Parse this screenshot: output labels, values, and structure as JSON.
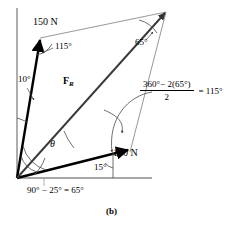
{
  "figure": {
    "caption": "(b)",
    "type": "parallelogram-law force diagram",
    "labels": {
      "force_150": "150 N",
      "force_100": "100 N",
      "resultant": "F",
      "resultant_sub": "R",
      "theta": "θ",
      "angle_115_upper": "115°",
      "angle_10": "10°",
      "angle_65_apex": "65°",
      "angle_15": "15°",
      "bottom_equation": "90° − 25° = 65°"
    },
    "fraction": {
      "numerator": "360°− 2(65°)",
      "denominator": "2",
      "result": "= 115°"
    },
    "colors": {
      "vector_stroke": "#000000",
      "construction_stroke": "#808080",
      "axis_stroke": "#8a8a8a",
      "arc_stroke": "#555555",
      "background": "#ffffff"
    }
  }
}
